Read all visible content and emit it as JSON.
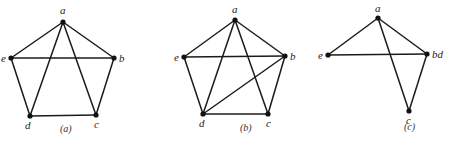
{
  "figure": {
    "graphs": [
      {
        "id": "a",
        "caption": "(a)",
        "caption_pos": [
          60,
          132
        ],
        "vertices": [
          {
            "label": "a",
            "x": 63,
            "y": 22,
            "lx": 60,
            "ly": 14
          },
          {
            "label": "b",
            "x": 114,
            "y": 58,
            "lx": 119,
            "ly": 62
          },
          {
            "label": "c",
            "x": 96,
            "y": 115,
            "lx": 94,
            "ly": 128
          },
          {
            "label": "d",
            "x": 30,
            "y": 116,
            "lx": 25,
            "ly": 129
          },
          {
            "label": "e",
            "x": 11,
            "y": 58,
            "lx": 1,
            "ly": 62
          }
        ],
        "edges": [
          [
            "a",
            "e"
          ],
          [
            "a",
            "b"
          ],
          [
            "a",
            "d"
          ],
          [
            "a",
            "c"
          ],
          [
            "e",
            "b"
          ],
          [
            "e",
            "d"
          ],
          [
            "b",
            "c"
          ],
          [
            "d",
            "c"
          ]
        ]
      },
      {
        "id": "b",
        "caption": "(b)",
        "caption_pos": [
          240,
          131
        ],
        "vertices": [
          {
            "label": "a",
            "x": 235,
            "y": 20,
            "lx": 232,
            "ly": 13
          },
          {
            "label": "b",
            "x": 285,
            "y": 56,
            "lx": 290,
            "ly": 60
          },
          {
            "label": "c",
            "x": 268,
            "y": 114,
            "lx": 266,
            "ly": 127
          },
          {
            "label": "d",
            "x": 203,
            "y": 114,
            "lx": 199,
            "ly": 127
          },
          {
            "label": "e",
            "x": 184,
            "y": 57,
            "lx": 174,
            "ly": 61
          }
        ],
        "edges": [
          [
            "a",
            "e"
          ],
          [
            "a",
            "b"
          ],
          [
            "a",
            "d"
          ],
          [
            "a",
            "c"
          ],
          [
            "e",
            "b"
          ],
          [
            "e",
            "d"
          ],
          [
            "b",
            "c"
          ],
          [
            "d",
            "c"
          ],
          [
            "d",
            "b"
          ]
        ]
      },
      {
        "id": "c",
        "caption": "(c)",
        "caption_pos": [
          404,
          130
        ],
        "vertices": [
          {
            "label": "a",
            "x": 378,
            "y": 18,
            "lx": 375,
            "ly": 12
          },
          {
            "label": "bd",
            "x": 427,
            "y": 54,
            "lx": 432,
            "ly": 58
          },
          {
            "label": "c",
            "x": 409,
            "y": 111,
            "lx": 406,
            "ly": 124
          },
          {
            "label": "e",
            "x": 328,
            "y": 55,
            "lx": 318,
            "ly": 59
          }
        ],
        "edges": [
          [
            "a",
            "e"
          ],
          [
            "a",
            "bd"
          ],
          [
            "a",
            "c"
          ],
          [
            "e",
            "bd"
          ],
          [
            "bd",
            "c"
          ]
        ]
      }
    ]
  }
}
